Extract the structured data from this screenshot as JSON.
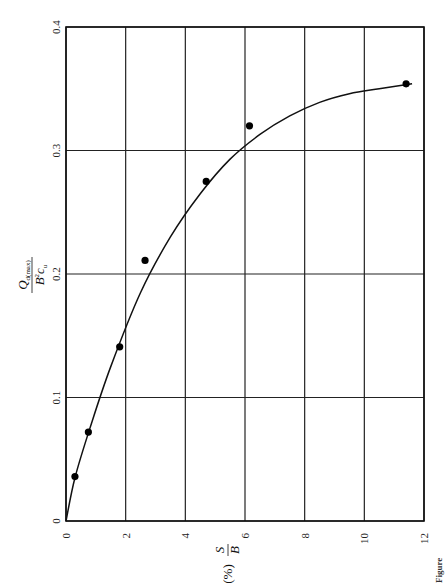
{
  "chart_data": {
    "type": "scatter",
    "orientation_note": "figure printed rotated 90 degrees counter-clockwise on page",
    "title": "",
    "xlabel": "S/B (%)",
    "ylabel": "Q_d(max) / (B^2 c_u)",
    "xlim": [
      0,
      12
    ],
    "ylim": [
      0,
      0.4
    ],
    "xticks": [
      0,
      2,
      4,
      6,
      8,
      10,
      12
    ],
    "yticks": [
      0,
      0.1,
      0.2,
      0.3,
      0.4
    ],
    "xtick_labels": [
      "0",
      "2",
      "4",
      "6",
      "8",
      "10",
      "12"
    ],
    "ytick_labels": [
      "0",
      "0.1",
      "0.2",
      "0.3",
      "0.4"
    ],
    "grid": true,
    "legend": null,
    "series": [
      {
        "name": "measured points",
        "marker": "filled-circle",
        "x": [
          0.3,
          0.75,
          1.8,
          2.65,
          4.7,
          6.15,
          11.4
        ],
        "y": [
          0.036,
          0.072,
          0.141,
          0.211,
          0.275,
          0.32,
          0.354
        ]
      },
      {
        "name": "fitted curve",
        "style": "solid-line",
        "x": [
          0,
          0.3,
          0.8,
          1.5,
          2.5,
          3.5,
          4.5,
          5.5,
          6.5,
          7.5,
          8.5,
          9.5,
          10.5,
          11.6
        ],
        "y": [
          0,
          0.035,
          0.075,
          0.125,
          0.185,
          0.23,
          0.265,
          0.293,
          0.313,
          0.328,
          0.339,
          0.346,
          0.35,
          0.354
        ]
      }
    ]
  },
  "labels": {
    "x_axis_main": "S",
    "x_axis_denominator": "B",
    "x_axis_unit": "(%)",
    "y_axis_numerator": "Q",
    "y_axis_numerator_sub": "d(max)",
    "y_axis_denominator": "B",
    "y_axis_denominator_sup": "2",
    "y_axis_denominator_c": "c",
    "y_axis_denominator_sub": "u",
    "figure_caption_fragment": "Figure"
  }
}
